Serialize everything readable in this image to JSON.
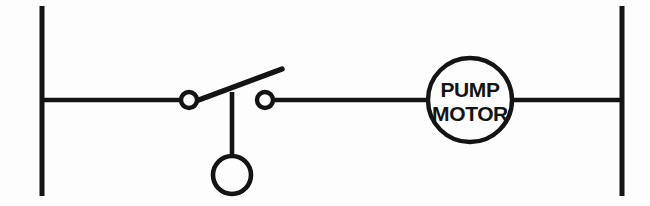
{
  "diagram": {
    "type": "ladder-logic-schematic",
    "background_color": "#fdfdfd",
    "line_color": "#141414",
    "canvas": {
      "width": 650,
      "height": 206
    },
    "power_rails": {
      "left": {
        "name": "left-power-rail",
        "x": 42,
        "y_top": 6,
        "y_bottom": 196
      },
      "right": {
        "name": "right-power-rail",
        "x": 622,
        "y_top": 6,
        "y_bottom": 196
      }
    },
    "rung": {
      "y": 100,
      "x_start": 42,
      "x_end": 622
    },
    "components": [
      {
        "id": "float-switch",
        "kind": "normally-open-contact",
        "label": "",
        "left_contact": {
          "cx": 189,
          "cy": 100,
          "r": 8
        },
        "right_contact": {
          "cx": 265,
          "cy": 100,
          "r": 8
        },
        "blade": {
          "x1": 196,
          "y1": 101,
          "x2": 282,
          "y2": 69
        },
        "float_rod": {
          "x": 232,
          "y_top": 92,
          "y_bottom": 157
        },
        "float_ball": {
          "cx": 232,
          "cy": 175,
          "r": 19
        }
      },
      {
        "id": "pump-motor",
        "kind": "motor-load",
        "circle": {
          "cx": 470,
          "cy": 100,
          "r": 42
        },
        "label_line1": "PUMP",
        "label_line2": "MOTOR"
      }
    ],
    "wires": [
      {
        "id": "wire-left-rail-to-contact",
        "x1": 42,
        "y1": 100,
        "x2": 182,
        "y2": 100
      },
      {
        "id": "wire-contact-to-motor",
        "x1": 272,
        "y1": 100,
        "x2": 428,
        "y2": 100
      },
      {
        "id": "wire-motor-to-right-rail",
        "x1": 512,
        "y1": 100,
        "x2": 622,
        "y2": 100
      }
    ]
  }
}
